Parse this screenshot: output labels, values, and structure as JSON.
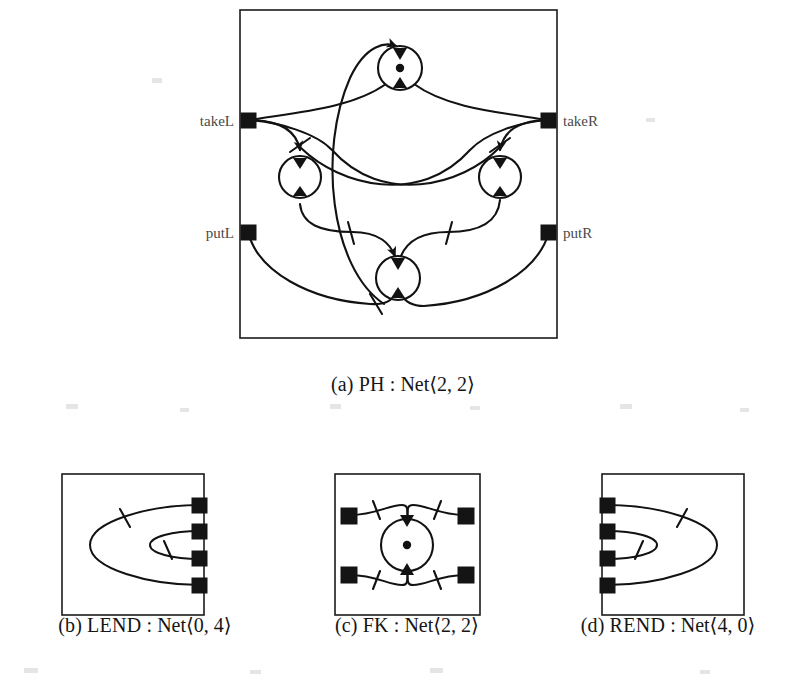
{
  "figure": {
    "background": "#ffffff",
    "ink": "#121212",
    "panels": [
      {
        "id": "ph",
        "caption_index": "(a)",
        "name": "PH",
        "type": "Net",
        "arity": "⟨2, 2⟩",
        "caption": "(a) PH : Net⟨2, 2⟩",
        "ports": [
          {
            "id": "takeL",
            "label": "takeL",
            "side": "left",
            "label_side": "left"
          },
          {
            "id": "putL",
            "label": "putL",
            "side": "left",
            "label_side": "left"
          },
          {
            "id": "takeR",
            "label": "takeR",
            "side": "right",
            "label_side": "right"
          },
          {
            "id": "putR",
            "label": "putR",
            "side": "right",
            "label_side": "right"
          }
        ],
        "places": [
          {
            "id": "p-top",
            "tokens": 1
          },
          {
            "id": "p-left",
            "tokens": 0
          },
          {
            "id": "p-right",
            "tokens": 0
          },
          {
            "id": "p-bottom",
            "tokens": 0
          }
        ],
        "place_count": 4,
        "token_count": 1
      },
      {
        "id": "lend",
        "caption_index": "(b)",
        "name": "LEND",
        "type": "Net",
        "arity": "⟨0, 4⟩",
        "caption": "(b) LEND : Net⟨0, 4⟩",
        "ports_right": 4,
        "ports_left": 0,
        "places": [],
        "wires": 2
      },
      {
        "id": "fk",
        "caption_index": "(c)",
        "name": "FK",
        "type": "Net",
        "arity": "⟨2, 2⟩",
        "caption": "(c) FK : Net⟨2, 2⟩",
        "ports_left": 2,
        "ports_right": 2,
        "places": [
          {
            "id": "fk-place",
            "tokens": 1
          }
        ],
        "place_count": 1,
        "token_count": 1
      },
      {
        "id": "rend",
        "caption_index": "(d)",
        "name": "REND",
        "type": "Net",
        "arity": "⟨4, 0⟩",
        "caption": "(d) REND : Net⟨4, 0⟩",
        "ports_left": 4,
        "ports_right": 0,
        "places": [],
        "wires": 2
      }
    ]
  },
  "labels": {
    "takeL": "takeL",
    "putL": "putL",
    "takeR": "takeR",
    "putR": "putR"
  },
  "captions": {
    "a_index": "(a)",
    "a_name": "PH",
    "a_rest": " : Net⟨2, 2⟩",
    "b_index": "(b)",
    "b_name": "LEND",
    "b_rest": " : Net⟨0, 4⟩",
    "c_index": "(c)",
    "c_name": "FK",
    "c_rest": " : Net⟨2, 2⟩",
    "d_index": "(d)",
    "d_name": "REND",
    "d_rest": " : Net⟨4, 0⟩"
  }
}
